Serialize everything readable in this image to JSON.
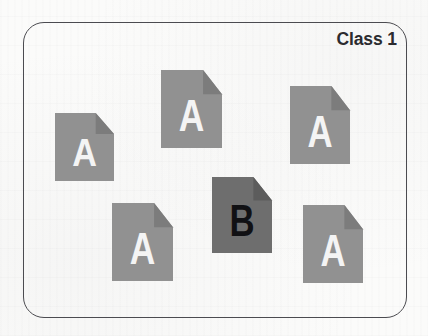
{
  "diagram": {
    "type": "class-document-grouping",
    "box": {
      "label": "Class 1",
      "border_color": "#4b4b50",
      "background_color": "#fbfbfa",
      "corner_radius_px": 21
    },
    "palette": {
      "document_light_gray": "#919191",
      "document_dark_gray": "#6e6e6e",
      "letter_light": "#f4f4f4",
      "letter_dark": "#111114",
      "fold_shadow": "#7c7c7c",
      "fold_shadow_dark": "#5c5c5c"
    },
    "legend": {
      "majority_label": "A",
      "minority_label": "B"
    },
    "counts": {
      "A": 5,
      "B": 1,
      "total": 6
    },
    "documents": [
      {
        "id": "doc-a-1",
        "label": "A",
        "fill": "#919191",
        "text_color": "#f4f4f4",
        "fold_fill": "#7c7c7c",
        "x": 55,
        "y": 113,
        "w": 59,
        "h": 68
      },
      {
        "id": "doc-a-2",
        "label": "A",
        "fill": "#919191",
        "text_color": "#f4f4f4",
        "fold_fill": "#7c7c7c",
        "x": 161,
        "y": 70,
        "w": 61,
        "h": 78
      },
      {
        "id": "doc-a-3",
        "label": "A",
        "fill": "#919191",
        "text_color": "#f4f4f4",
        "fold_fill": "#7c7c7c",
        "x": 290,
        "y": 86,
        "w": 60,
        "h": 78
      },
      {
        "id": "doc-b-1",
        "label": "B",
        "fill": "#6e6e6e",
        "text_color": "#111114",
        "fold_fill": "#5c5c5c",
        "x": 212,
        "y": 177,
        "w": 60,
        "h": 76
      },
      {
        "id": "doc-a-4",
        "label": "A",
        "fill": "#919191",
        "text_color": "#f4f4f4",
        "fold_fill": "#7c7c7c",
        "x": 112,
        "y": 203,
        "w": 61,
        "h": 78
      },
      {
        "id": "doc-a-5",
        "label": "A",
        "fill": "#919191",
        "text_color": "#f4f4f4",
        "fold_fill": "#7c7c7c",
        "x": 303,
        "y": 205,
        "w": 60,
        "h": 78
      }
    ]
  }
}
